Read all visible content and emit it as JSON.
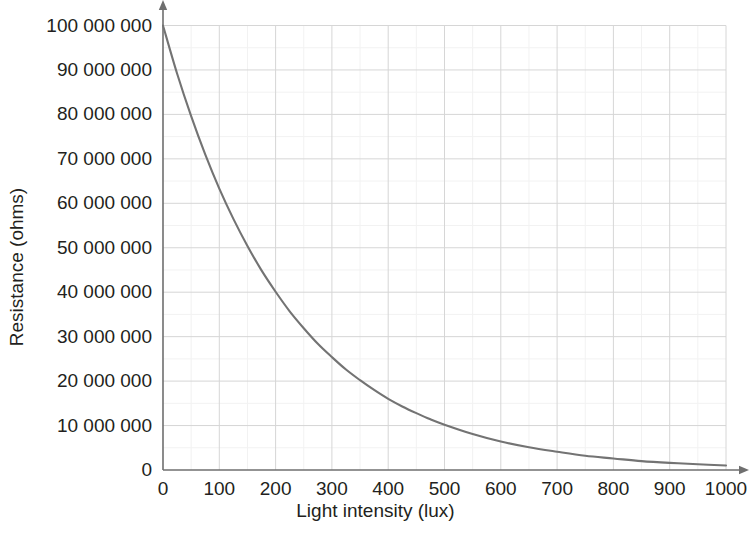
{
  "chart_data": {
    "type": "line",
    "title": "",
    "xlabel": "Light intensity (lux)",
    "ylabel": "Resistance (ohms)",
    "xlim": [
      0,
      1000
    ],
    "ylim": [
      0,
      100000000
    ],
    "grid": true,
    "legend": null,
    "series": [
      {
        "name": "Resistance vs light intensity",
        "color": "#737373",
        "model": "R = 100000000 * exp(-x / 218)",
        "x": [
          0,
          25,
          50,
          75,
          100,
          125,
          150,
          175,
          200,
          225,
          250,
          275,
          300,
          325,
          350,
          375,
          400,
          425,
          450,
          475,
          500,
          550,
          600,
          650,
          700,
          750,
          800,
          850,
          900,
          950,
          1000
        ],
        "values": [
          100000000,
          89200000,
          79600000,
          71000000,
          63300000,
          56500000,
          50400000,
          44900000,
          40100000,
          35700000,
          31900000,
          28400000,
          25400000,
          22600000,
          20200000,
          18000000,
          16000000,
          14300000,
          12800000,
          11400000,
          10200000,
          8100000,
          6400000,
          5100000,
          4100000,
          3200000,
          2600000,
          2000000,
          1600000,
          1300000,
          1000000
        ]
      }
    ],
    "x_ticks": [
      {
        "value": 0,
        "label": "0"
      },
      {
        "value": 100,
        "label": "100"
      },
      {
        "value": 200,
        "label": "200"
      },
      {
        "value": 300,
        "label": "300"
      },
      {
        "value": 400,
        "label": "400"
      },
      {
        "value": 500,
        "label": "500"
      },
      {
        "value": 600,
        "label": "600"
      },
      {
        "value": 700,
        "label": "700"
      },
      {
        "value": 800,
        "label": "800"
      },
      {
        "value": 900,
        "label": "900"
      },
      {
        "value": 1000,
        "label": "1000"
      }
    ],
    "y_ticks": [
      {
        "value": 0,
        "label": "0"
      },
      {
        "value": 10000000,
        "label": "10 000 000"
      },
      {
        "value": 20000000,
        "label": "20 000 000"
      },
      {
        "value": 30000000,
        "label": "30 000 000"
      },
      {
        "value": 40000000,
        "label": "40 000 000"
      },
      {
        "value": 50000000,
        "label": "50 000 000"
      },
      {
        "value": 60000000,
        "label": "60 000 000"
      },
      {
        "value": 70000000,
        "label": "70 000 000"
      },
      {
        "value": 80000000,
        "label": "80 000 000"
      },
      {
        "value": 90000000,
        "label": "90 000 000"
      },
      {
        "value": 100000000,
        "label": "100 000 000"
      }
    ],
    "colors": {
      "curve": "#737373",
      "axis": "#6f6f6f",
      "major_grid": "#d6d6d6",
      "minor_grid": "#f2f2f2",
      "text": "#231f20",
      "background": "#ffffff"
    }
  }
}
